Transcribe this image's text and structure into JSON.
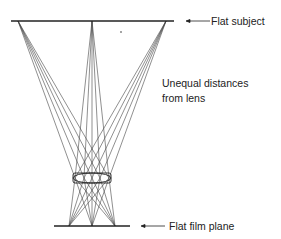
{
  "diagram": {
    "labels": {
      "subject": "Flat subject",
      "distances_line1": "Unequal distances",
      "distances_line2": "from lens",
      "film": "Flat film plane"
    },
    "colors": {
      "line": "#333333",
      "text": "#222222",
      "background": "#ffffff"
    },
    "subject_plane": {
      "x1": 11,
      "x2": 174,
      "y": 21
    },
    "film_plane": {
      "x1": 54,
      "x2": 130,
      "y": 226
    },
    "lens": {
      "cx": 92,
      "cy": 178,
      "rx": 19,
      "ry": 5
    },
    "subject_points": [
      18,
      92,
      166
    ],
    "film_points": [
      115,
      92,
      69
    ],
    "lens_points": [
      75,
      84,
      92,
      100,
      109
    ]
  }
}
